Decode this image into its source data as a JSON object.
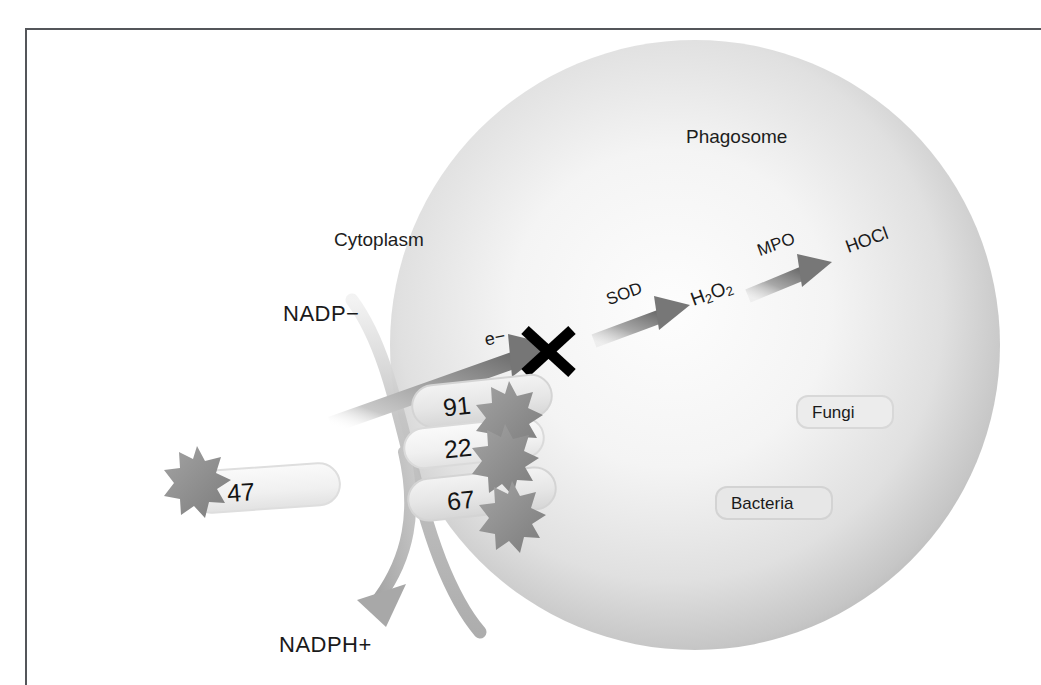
{
  "figure": {
    "background_color": "#ffffff",
    "border_color": "#54565a"
  },
  "compartments": {
    "phagosome_label": "Phagosome",
    "cytoplasm_label": "Cytoplasm",
    "phagosome_fill_outer": "#b5b5b5",
    "phagosome_fill_inner": "#fbfbfb",
    "membrane_color": "#b9b9b9"
  },
  "substrates": {
    "input_label": "NADP−",
    "output_label": "NADPH+",
    "electron_label": "e−"
  },
  "reactions": [
    {
      "enzyme_label": "SOD",
      "product_label": "H2O2",
      "product_html": "H<span class=\"sub\">2</span>O<span class=\"sub\">2</span>",
      "arrow_color": "#8e8e8e"
    },
    {
      "enzyme_label": "MPO",
      "product_label": "HOCl",
      "product_html": "HOCl",
      "arrow_color": "#8e8e8e"
    }
  ],
  "oxidase_subunits": [
    {
      "name": "gp91phox",
      "label": "91",
      "position": "membrane-upper",
      "has_starburst": true
    },
    {
      "name": "p22phox",
      "label": "22",
      "position": "membrane-mid",
      "has_starburst": true
    },
    {
      "name": "p47phox",
      "label": "47",
      "position": "cytosolic-left",
      "has_starburst": true
    },
    {
      "name": "p67phox",
      "label": "67",
      "position": "membrane-lower",
      "has_starburst": true
    }
  ],
  "targets": [
    {
      "label": "Fungi",
      "shape": "pill"
    },
    {
      "label": "Bacteria",
      "shape": "pill"
    }
  ],
  "block_marker": {
    "name": "blocked-electron-transfer",
    "glyph": "X",
    "color": "#000000",
    "meaning": "electron transfer blocked"
  },
  "colors": {
    "text": "#1a1a1a",
    "arrow_gray": "#8e8e8e",
    "starburst": "#8c8c8c",
    "pill_fill": "#e9e9e9",
    "pill_stroke": "#d2d2d2"
  }
}
